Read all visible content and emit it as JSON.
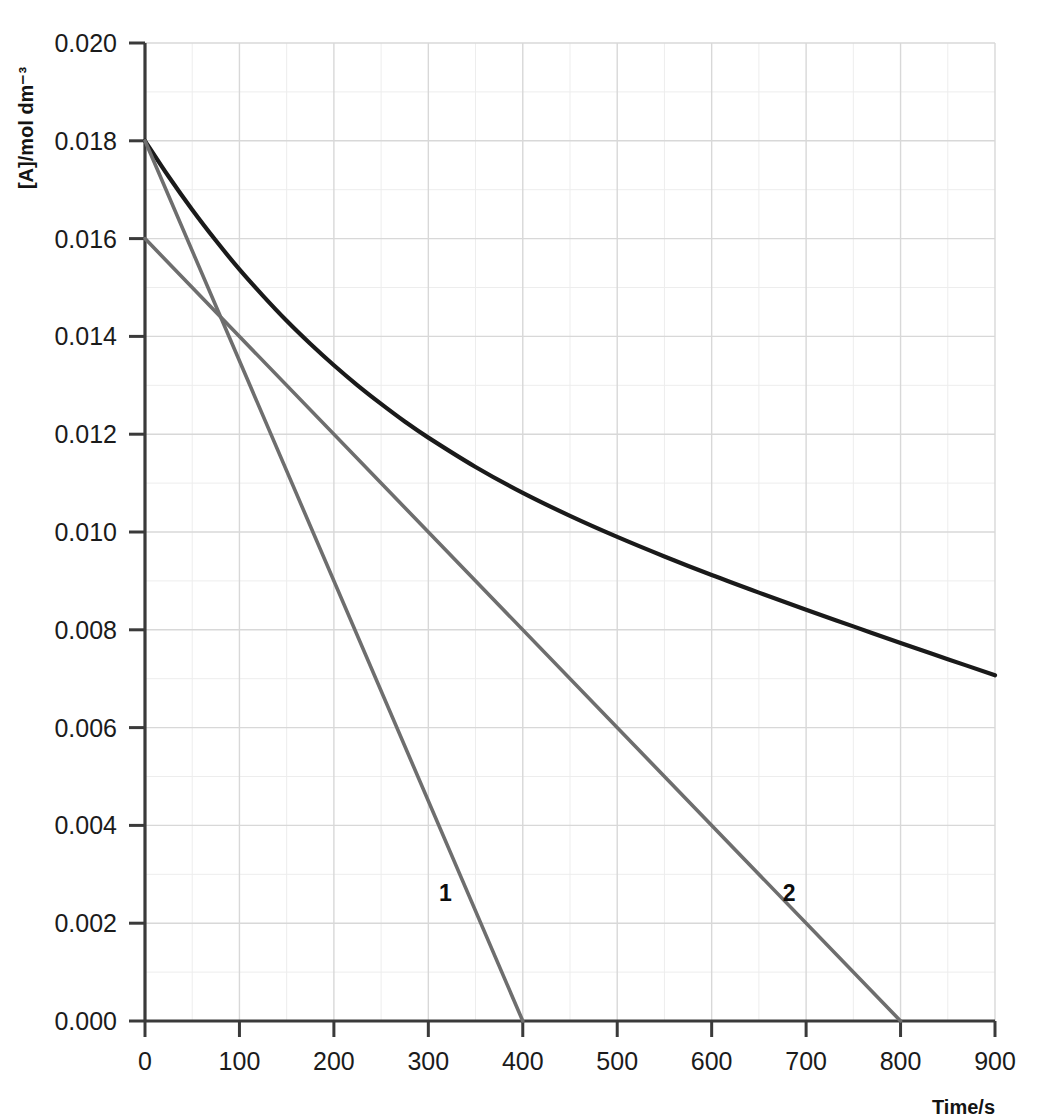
{
  "chart_data": {
    "type": "line",
    "title": "",
    "xlabel": "Time/s",
    "ylabel": "[A]/mol dm⁻³",
    "xlim": [
      0,
      900
    ],
    "ylim": [
      0.0,
      0.02
    ],
    "grid": true,
    "minor_grid": true,
    "legend": "none",
    "xticks": [
      0,
      100,
      200,
      300,
      400,
      500,
      600,
      700,
      800,
      900
    ],
    "xtick_labels": [
      "0",
      "100",
      "200",
      "300",
      "400",
      "500",
      "600",
      "700",
      "800",
      "900"
    ],
    "yticks": [
      0.0,
      0.002,
      0.004,
      0.006,
      0.008,
      0.01,
      0.012,
      0.014,
      0.016,
      0.018,
      0.02
    ],
    "ytick_labels": [
      "0.000",
      "0.002",
      "0.004",
      "0.006",
      "0.008",
      "0.010",
      "0.012",
      "0.014",
      "0.016",
      "0.018",
      "0.020"
    ],
    "series": [
      {
        "name": "concentration-decay-curve",
        "kind": "curve",
        "color": "#1a1a1a",
        "width": 4.2,
        "x": [
          0,
          25,
          50,
          75,
          100,
          125,
          150,
          175,
          200,
          225,
          250,
          275,
          300,
          350,
          400,
          450,
          500,
          550,
          600,
          650,
          700,
          750,
          800,
          850,
          900
        ],
        "y": [
          0.018,
          0.01727,
          0.01659,
          0.01596,
          0.01537,
          0.01483,
          0.01432,
          0.01385,
          0.01341,
          0.013,
          0.01262,
          0.01226,
          0.01193,
          0.01133,
          0.0108,
          0.01033,
          0.0099,
          0.0095,
          0.00912,
          0.00876,
          0.00841,
          0.00807,
          0.00773,
          0.0074,
          0.00707
        ]
      },
      {
        "name": "tangent-line-1",
        "kind": "tangent",
        "color": "#6e6e6e",
        "width": 3.6,
        "label": "1",
        "label_x": 318,
        "label_y": 0.00245,
        "x": [
          0,
          400
        ],
        "y": [
          0.018,
          0.0
        ]
      },
      {
        "name": "tangent-line-2",
        "kind": "tangent",
        "color": "#6e6e6e",
        "width": 3.6,
        "label": "2",
        "label_x": 682,
        "label_y": 0.00245,
        "x": [
          0,
          800
        ],
        "y": [
          0.016,
          0.0
        ]
      }
    ],
    "annotations": [
      {
        "text": "1",
        "x": 318,
        "y": 0.00245
      },
      {
        "text": "2",
        "x": 682,
        "y": 0.00245
      }
    ],
    "colors": {
      "curve": "#1a1a1a",
      "tangent": "#6e6e6e",
      "axis": "#3a3a3a",
      "grid_major": "#d8d8d8",
      "grid_minor": "#ededed",
      "text": "#141414",
      "background": "#ffffff"
    }
  }
}
